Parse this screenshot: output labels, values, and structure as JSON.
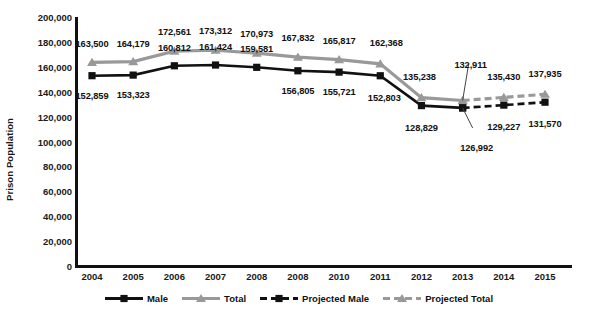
{
  "chart_data": {
    "type": "line",
    "title": "",
    "xlabel": "",
    "ylabel": "Prison Population",
    "ylim": [
      0,
      200000
    ],
    "yticks": [
      "0",
      "20,000",
      "40,000",
      "60,000",
      "80,000",
      "100,000",
      "120,000",
      "140,000",
      "160,000",
      "180,000",
      "200,000"
    ],
    "ytick_values": [
      0,
      20000,
      40000,
      60000,
      80000,
      100000,
      120000,
      140000,
      160000,
      180000,
      200000
    ],
    "grid": false,
    "legend_position": "bottom",
    "categories": [
      "2004",
      "2005",
      "2006",
      "2007",
      "2008",
      "2008",
      "2010",
      "2011",
      "2012",
      "2013",
      "2014",
      "2015"
    ],
    "series": [
      {
        "name": "Male",
        "color": "#111111",
        "marker": "square",
        "linestyle": "solid",
        "values": [
          152859,
          153323,
          160812,
          161424,
          159581,
          156805,
          155721,
          152803,
          128829,
          126992,
          null,
          null
        ],
        "labels": [
          "152,859",
          "153,323",
          "160,812",
          "161,424",
          "159,581",
          "156,805",
          "155,721",
          "152,803",
          "128,829",
          "126,992",
          "",
          ""
        ]
      },
      {
        "name": "Total",
        "color": "#999999",
        "marker": "triangle",
        "linestyle": "solid",
        "values": [
          163500,
          164179,
          172561,
          173312,
          170973,
          167832,
          165817,
          162368,
          135238,
          132911,
          null,
          null
        ],
        "labels": [
          "163,500",
          "164,179",
          "172,561",
          "173,312",
          "170,973",
          "167,832",
          "165,817",
          "162,368",
          "135,238",
          "132,911",
          "",
          ""
        ]
      },
      {
        "name": "Projected Male",
        "color": "#111111",
        "marker": "square",
        "linestyle": "dashed",
        "values": [
          null,
          null,
          null,
          null,
          null,
          null,
          null,
          null,
          null,
          126992,
          129227,
          131570
        ],
        "labels": [
          "",
          "",
          "",
          "",
          "",
          "",
          "",
          "",
          "",
          "",
          "129,227",
          "131,570"
        ]
      },
      {
        "name": "Projected Total",
        "color": "#999999",
        "marker": "triangle",
        "linestyle": "dashed",
        "values": [
          null,
          null,
          null,
          null,
          null,
          null,
          null,
          null,
          null,
          132911,
          135430,
          137935
        ],
        "labels": [
          "",
          "",
          "",
          "",
          "",
          "",
          "",
          "",
          "",
          "",
          "135,430",
          "137,935"
        ]
      }
    ],
    "legend": [
      "Male",
      "Total",
      "Projected Male",
      "Projected Total"
    ]
  },
  "colors": {
    "male": "#111111",
    "total": "#999999",
    "axis": "#111111",
    "text": "#1a1a1a",
    "background": "#ffffff"
  }
}
